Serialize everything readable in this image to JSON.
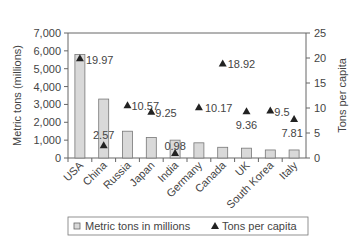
{
  "chart_data": {
    "type": "bar",
    "title": "",
    "categories": [
      "USA",
      "China",
      "Russia",
      "Japan",
      "India",
      "Germany",
      "Canada",
      "UK",
      "South Korea",
      "Italy"
    ],
    "series": [
      {
        "name": "Metric tons in millions",
        "type": "bar",
        "axis": "left",
        "values": [
          5800,
          3300,
          1500,
          1150,
          1000,
          850,
          600,
          550,
          450,
          450
        ]
      },
      {
        "name": "Tons per capita",
        "type": "scatter",
        "axis": "right",
        "values": [
          19.97,
          2.57,
          10.57,
          9.25,
          0.98,
          10.17,
          18.92,
          9.36,
          9.5,
          7.81
        ],
        "labels": [
          "19.97",
          "2.57",
          "10.57",
          "9.25",
          "0.98",
          "10.17",
          "18.92",
          "9.36",
          "9.5",
          "7.81"
        ]
      }
    ],
    "ylabel": "Metric tons (millions)",
    "y2label": "Tons per capita",
    "ylim": [
      0,
      7000
    ],
    "y2lim": [
      0,
      25
    ],
    "yticks": [
      "0",
      "1,000",
      "2,000",
      "3,000",
      "4,000",
      "5,000",
      "6,000",
      "7,000"
    ],
    "y2ticks": [
      "0",
      "5",
      "10",
      "15",
      "20",
      "25"
    ],
    "grid": false,
    "legend_position": "bottom"
  },
  "legend": {
    "bar": "Metric tons in millions",
    "marker": "Tons per capita"
  }
}
